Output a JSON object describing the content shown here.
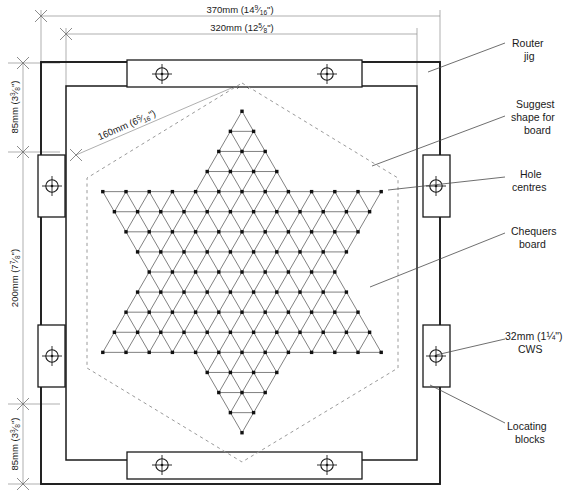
{
  "drawing": {
    "title": "Router jig and chequers board layout",
    "background": "#ffffff",
    "line_color": "#1a1a1a",
    "thin_line_color": "#555555",
    "dash_color": "#8a8a8a"
  },
  "dimensions": {
    "top_outer": {
      "label": "370mm (14",
      "whole": "370mm (14",
      "num": "9",
      "den": "16",
      "suffix": "\")"
    },
    "top_inner": {
      "whole": "320mm (12",
      "num": "5",
      "den": "8",
      "suffix": "\")"
    },
    "diagonal": {
      "whole": "160mm (6",
      "num": "5",
      "den": "16",
      "suffix": "\")"
    },
    "left_top": {
      "whole": "85mm (3",
      "num": "3",
      "den": "8",
      "suffix": "\")"
    },
    "left_middle": {
      "whole": "200mm (7",
      "num": "7",
      "den": "8",
      "suffix": "\")"
    },
    "left_bottom": {
      "whole": "85mm (3",
      "num": "3",
      "den": "8",
      "suffix": "\")"
    }
  },
  "callouts": [
    {
      "id": "router-jig",
      "lines": [
        "Router",
        "jig"
      ]
    },
    {
      "id": "suggest-shape",
      "lines": [
        "Suggest",
        "shape for",
        "board"
      ]
    },
    {
      "id": "hole-centres",
      "lines": [
        "Hole",
        "centres"
      ]
    },
    {
      "id": "chequers-board",
      "lines": [
        "Chequers",
        "board"
      ]
    },
    {
      "id": "cws",
      "lines": [
        "32mm (1¼\")",
        "CWS"
      ]
    },
    {
      "id": "locating-blocks",
      "lines": [
        "Locating",
        "blocks"
      ]
    }
  ],
  "board": {
    "type": "chinese-checkers-star",
    "hole_count": 121,
    "rows": [
      1,
      2,
      3,
      4,
      13,
      12,
      11,
      10,
      9,
      10,
      11,
      12,
      13,
      4,
      3,
      2,
      1
    ],
    "pitch_px": 23.2,
    "center": {
      "x": 242,
      "y": 272
    }
  },
  "screw_holes": [
    {
      "x": 162,
      "y": 74
    },
    {
      "x": 327,
      "y": 74
    },
    {
      "x": 162,
      "y": 465
    },
    {
      "x": 327,
      "y": 465
    },
    {
      "x": 52,
      "y": 186
    },
    {
      "x": 52,
      "y": 356
    },
    {
      "x": 436,
      "y": 186
    },
    {
      "x": 436,
      "y": 356
    }
  ]
}
